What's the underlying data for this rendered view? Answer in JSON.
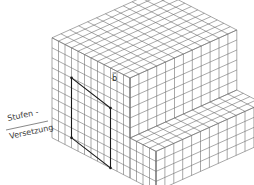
{
  "figure": {
    "labels": {
      "step_line1": "Stufen -",
      "step_line2": "Versetzung",
      "burgers_vector": "b"
    },
    "colors": {
      "background": "#ffffff",
      "grid_line": "#6e6e6e",
      "circuit_line": "#1a1a1a",
      "text": "#3a3a3a"
    },
    "lattice": {
      "cubes_left": 12,
      "cubes_right": 12,
      "layers_upper": 6,
      "layers_lower_step": 4,
      "step_depth_cubes": 4
    }
  }
}
